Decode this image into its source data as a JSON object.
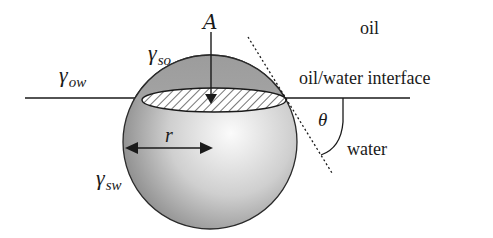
{
  "diagram": {
    "type": "contact-angle-particle-at-interface",
    "labels": {
      "area": "A",
      "gamma_so": {
        "symbol": "γ",
        "subscript": "so"
      },
      "gamma_ow": {
        "symbol": "γ",
        "subscript": "ow"
      },
      "gamma_sw": {
        "symbol": "γ",
        "subscript": "sw"
      },
      "radius": "r",
      "angle": "θ",
      "oil": "oil",
      "interface": "oil/water interface",
      "water": "water"
    },
    "colors": {
      "line": "#1a1a1a",
      "sphere_light": "#f4f4f4",
      "sphere_dark": "#8a8a8a",
      "cap": "#9a9a9a"
    }
  }
}
